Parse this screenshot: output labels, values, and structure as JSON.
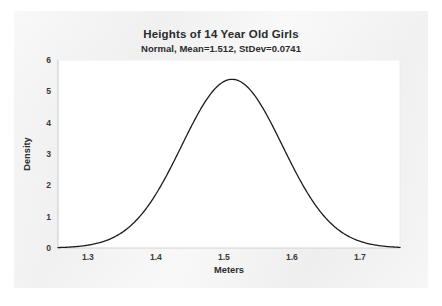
{
  "chart_data": {
    "type": "line",
    "title": "Heights of 14 Year Old Girls",
    "subtitle": "Normal, Mean=1.512, StDev=0.0741",
    "xlabel": "Meters",
    "ylabel": "Density",
    "distribution": {
      "name": "Normal",
      "mean": 1.512,
      "stdev": 0.0741,
      "peak_density": 5.383
    },
    "xlim": [
      1.256,
      1.759
    ],
    "ylim": [
      0,
      6.0
    ],
    "xticks": [
      1.3,
      1.4,
      1.5,
      1.6,
      1.7
    ],
    "xtick_labels": [
      "1.3",
      "1.4",
      "1.5",
      "1.6",
      "1.7"
    ],
    "yticks": [
      0,
      1,
      2,
      3,
      4,
      5,
      6
    ],
    "ytick_labels": [
      "0",
      "1",
      "2",
      "3",
      "4",
      "5",
      "6"
    ],
    "grid": false,
    "legend": null,
    "series": [
      {
        "name": "Normal density",
        "color": "#1c1c1c",
        "line_width": 1.3,
        "x": [
          1.256,
          1.276,
          1.296,
          1.316,
          1.336,
          1.356,
          1.376,
          1.396,
          1.416,
          1.436,
          1.456,
          1.476,
          1.496,
          1.512,
          1.532,
          1.552,
          1.572,
          1.592,
          1.612,
          1.632,
          1.652,
          1.672,
          1.692,
          1.712,
          1.732,
          1.759
        ],
        "values": [
          0.03,
          0.07,
          0.16,
          0.33,
          0.64,
          1.14,
          1.87,
          2.82,
          3.89,
          4.85,
          5.42,
          5.38,
          4.79,
          5.38,
          4.34,
          3.34,
          2.35,
          1.52,
          0.9,
          0.49,
          0.24,
          0.11,
          0.05,
          0.02,
          0.01,
          0.0
        ]
      }
    ]
  },
  "axes": {
    "x_tick_label_color": "#3a3a3a",
    "axis_line_color": "#d8d8d8",
    "curve_color": "#1c1c1c",
    "plot_background": "#ffffff",
    "panel_background": "#f1f1f1"
  }
}
